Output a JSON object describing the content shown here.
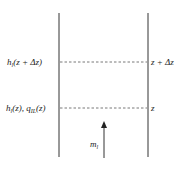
{
  "diagram": {
    "type": "control-volume column",
    "walls": [
      {
        "x": 59
      },
      {
        "x": 148
      }
    ],
    "levels": [
      {
        "name": "upper",
        "y": 62,
        "left_label": "h",
        "left_sub": "l",
        "left_rest": "(z + Δz)",
        "right_label": "z + Δz"
      },
      {
        "name": "lower",
        "y": 108,
        "left_label": "h",
        "left_sub": "l",
        "left_rest": "(z), q",
        "left_sub2": "IL",
        "left_rest2": "(z)",
        "right_label": "z"
      }
    ],
    "flow_arrow": {
      "label": "m",
      "label_sub": "l",
      "direction": "up"
    },
    "colors": {
      "line": "#333333",
      "dash": "#555555",
      "background": "#ffffff"
    }
  }
}
